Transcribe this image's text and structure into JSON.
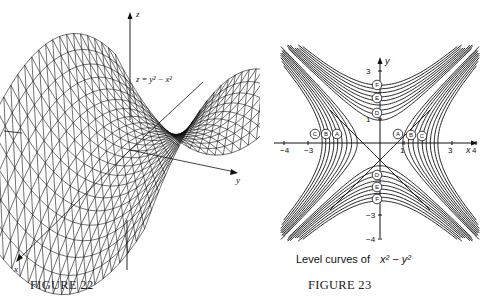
{
  "figure22": {
    "caption": "FIGURE 22",
    "equation": "z = y² − x²",
    "axes": {
      "z": "z",
      "y": "y",
      "x": "x"
    },
    "description": "Wireframe 3D surface of saddle z = y^2 - x^2"
  },
  "figure23": {
    "caption": "FIGURE 23",
    "title_prefix": "Level curves of",
    "title_math": "x² − y²",
    "axes": {
      "x": "x",
      "y": "y"
    },
    "x_ticks": [
      "−4",
      "−3",
      "1",
      "3",
      "4"
    ],
    "y_ticks": [
      "3",
      "1",
      "−3",
      "−4"
    ],
    "curve_labels_horizontal_left": [
      "C",
      "B",
      "A"
    ],
    "curve_labels_horizontal_right": [
      "A",
      "B",
      "C"
    ],
    "curve_labels_vertical_top": [
      "F",
      "E",
      "D"
    ],
    "curve_labels_vertical_bottom": [
      "D",
      "E",
      "F"
    ]
  },
  "chart_data": [
    {
      "type": "surface",
      "title": "z = y^2 - x^2",
      "xlabel": "x",
      "ylabel": "y",
      "zlabel": "z",
      "caption": "FIGURE 22"
    },
    {
      "type": "contour",
      "title": "Level curves of x^2 - y^2",
      "xlabel": "x",
      "ylabel": "y",
      "x_ticks": [
        -4,
        -3,
        1,
        3,
        4
      ],
      "y_ticks": [
        3,
        1,
        -3,
        -4
      ],
      "xlim": [
        -4.5,
        4.5
      ],
      "ylim": [
        -4.5,
        4.5
      ],
      "level_groups": {
        "A,B,C": "positive levels (hyperbolas opening left/right)",
        "D,E,F": "negative levels (hyperbolas opening up/down)"
      },
      "caption": "FIGURE 23"
    }
  ]
}
